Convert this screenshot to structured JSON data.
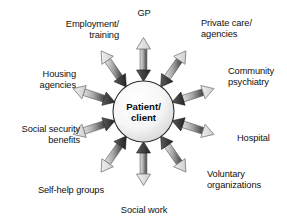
{
  "diagram": {
    "type": "radial-hub-and-spoke",
    "title_text_visible": false,
    "center": {
      "label": "Patient/\nclient",
      "shape": "circle",
      "fill_color": "#f2f2f2",
      "outline_color": "#2a2a2a"
    },
    "arrow_style": {
      "description": "double-headed arrows, dark head pointing inward to center, light gray head pointing outward to label",
      "inward_head_color": "#3a3a3a",
      "outward_head_color": "#d8d8d8",
      "shaft_gradient_from": "#cfcfcf",
      "shaft_gradient_to": "#4a4a4a",
      "stroke_color": "#5a5a5a"
    },
    "spokes": [
      {
        "id": "gp",
        "label": "GP",
        "angle_deg": 90,
        "label_align": "center",
        "label_x": 129,
        "label_y": 8,
        "label_width": 30
      },
      {
        "id": "private-care-agencies",
        "label": "Private care/\nagencies",
        "angle_deg": 55,
        "label_align": "left",
        "label_x": 201,
        "label_y": 18,
        "label_width": 72
      },
      {
        "id": "community-psychiatry",
        "label": "Community\npsychiatry",
        "angle_deg": 18,
        "label_align": "left",
        "label_x": 228,
        "label_y": 66,
        "label_width": 62
      },
      {
        "id": "hospital",
        "label": "Hospital",
        "angle_deg": -18,
        "label_align": "left",
        "label_x": 237,
        "label_y": 133,
        "label_width": 50
      },
      {
        "id": "voluntary-organizations",
        "label": "Voluntary\norganizations",
        "angle_deg": -55,
        "label_align": "left",
        "label_x": 207,
        "label_y": 169,
        "label_width": 78
      },
      {
        "id": "social-work",
        "label": "Social work",
        "angle_deg": -90,
        "label_align": "center",
        "label_x": 112,
        "label_y": 205,
        "label_width": 64
      },
      {
        "id": "self-help-groups",
        "label": "Self-help groups",
        "angle_deg": -125,
        "label_align": "right",
        "label_x": 28,
        "label_y": 185,
        "label_width": 76
      },
      {
        "id": "social-security-benefits",
        "label": "Social security\nbenefits",
        "angle_deg": -162,
        "label_align": "right",
        "label_x": 4,
        "label_y": 124,
        "label_width": 76
      },
      {
        "id": "housing-agencies",
        "label": "Housing\nagencies",
        "angle_deg": 162,
        "label_align": "right",
        "label_x": 20,
        "label_y": 69,
        "label_width": 56
      },
      {
        "id": "employment-training",
        "label": "Employment/\ntraining",
        "angle_deg": 125,
        "label_align": "right",
        "label_x": 47,
        "label_y": 19,
        "label_width": 72
      }
    ]
  }
}
